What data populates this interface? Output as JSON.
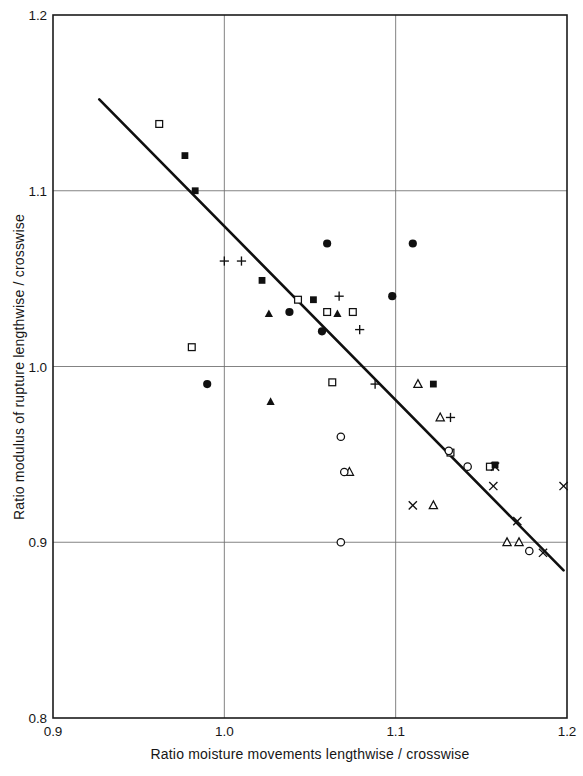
{
  "chart_data": {
    "type": "scatter",
    "title": "",
    "xlabel": "Ratio moisture movements lengthwise / crosswise",
    "ylabel": "Ratio modulus of rupture lengthwise / crosswise",
    "xlim": [
      0.9,
      1.2
    ],
    "ylim": [
      0.8,
      1.2
    ],
    "xticks": [
      "0.9",
      "1.0",
      "1.1",
      "1.2"
    ],
    "xtick_values": [
      0.9,
      1.0,
      1.1,
      1.2
    ],
    "yticks": [
      "0.8",
      "0.9",
      "1.0",
      "1.1",
      "1.2"
    ],
    "ytick_values": [
      0.8,
      0.9,
      1.0,
      1.1,
      1.2
    ],
    "grid": true,
    "grid_x_values": [
      1.0,
      1.1
    ],
    "grid_y_values": [
      0.9,
      1.0,
      1.1
    ],
    "legend": "none",
    "marker_color": "#101010",
    "trend_line": {
      "label": "regression line",
      "x_start": 0.927,
      "y_start": 1.152,
      "x_end": 1.198,
      "y_end": 0.884
    },
    "series": [
      {
        "name": "open-square",
        "marker": "open-square",
        "points": [
          {
            "x": 0.962,
            "y": 1.138
          },
          {
            "x": 0.981,
            "y": 1.011
          },
          {
            "x": 1.043,
            "y": 1.038
          },
          {
            "x": 1.06,
            "y": 1.031
          },
          {
            "x": 1.075,
            "y": 1.031
          },
          {
            "x": 1.063,
            "y": 0.991
          },
          {
            "x": 1.132,
            "y": 0.951
          },
          {
            "x": 1.155,
            "y": 0.943
          }
        ]
      },
      {
        "name": "filled-square",
        "marker": "filled-square",
        "points": [
          {
            "x": 0.977,
            "y": 1.12
          },
          {
            "x": 0.983,
            "y": 1.1
          },
          {
            "x": 1.022,
            "y": 1.049
          },
          {
            "x": 1.052,
            "y": 1.038
          },
          {
            "x": 1.122,
            "y": 0.99
          },
          {
            "x": 1.158,
            "y": 0.944
          }
        ]
      },
      {
        "name": "filled-circle",
        "marker": "filled-circle",
        "points": [
          {
            "x": 0.99,
            "y": 0.99
          },
          {
            "x": 1.06,
            "y": 1.07
          },
          {
            "x": 1.11,
            "y": 1.07
          },
          {
            "x": 1.098,
            "y": 1.04
          },
          {
            "x": 1.057,
            "y": 1.02
          },
          {
            "x": 1.038,
            "y": 1.031
          }
        ]
      },
      {
        "name": "filled-triangle",
        "marker": "filled-triangle",
        "points": [
          {
            "x": 1.026,
            "y": 1.03
          },
          {
            "x": 1.066,
            "y": 1.03
          },
          {
            "x": 1.027,
            "y": 0.98
          }
        ]
      },
      {
        "name": "open-triangle",
        "marker": "open-triangle",
        "points": [
          {
            "x": 1.113,
            "y": 0.99
          },
          {
            "x": 1.126,
            "y": 0.971
          },
          {
            "x": 1.073,
            "y": 0.94
          },
          {
            "x": 1.122,
            "y": 0.921
          },
          {
            "x": 1.165,
            "y": 0.9
          },
          {
            "x": 1.172,
            "y": 0.9
          }
        ]
      },
      {
        "name": "plus",
        "marker": "plus",
        "points": [
          {
            "x": 1.0,
            "y": 1.06
          },
          {
            "x": 1.01,
            "y": 1.06
          },
          {
            "x": 1.067,
            "y": 1.04
          },
          {
            "x": 1.079,
            "y": 1.021
          },
          {
            "x": 1.088,
            "y": 0.99
          },
          {
            "x": 1.132,
            "y": 0.971
          }
        ]
      },
      {
        "name": "open-circle",
        "marker": "open-circle",
        "points": [
          {
            "x": 1.068,
            "y": 0.96
          },
          {
            "x": 1.07,
            "y": 0.94
          },
          {
            "x": 1.068,
            "y": 0.9
          },
          {
            "x": 1.131,
            "y": 0.952
          },
          {
            "x": 1.142,
            "y": 0.943
          },
          {
            "x": 1.178,
            "y": 0.895
          }
        ]
      },
      {
        "name": "cross",
        "marker": "cross",
        "points": [
          {
            "x": 1.11,
            "y": 0.921
          },
          {
            "x": 1.158,
            "y": 0.943
          },
          {
            "x": 1.157,
            "y": 0.932
          },
          {
            "x": 1.171,
            "y": 0.912
          },
          {
            "x": 1.186,
            "y": 0.894
          },
          {
            "x": 1.198,
            "y": 0.932
          }
        ]
      }
    ]
  }
}
